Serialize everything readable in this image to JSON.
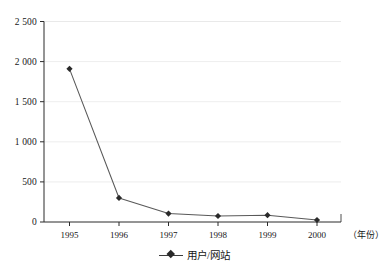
{
  "chart_data": {
    "type": "line",
    "title": "",
    "subtitle": "",
    "xlabel": "（年份）",
    "ylabel": "",
    "categories": [
      "1995",
      "1996",
      "1997",
      "1998",
      "1999",
      "2000"
    ],
    "series": [
      {
        "name": "用户/网站",
        "values": [
          1910,
          300,
          105,
          75,
          85,
          25
        ]
      }
    ],
    "ylim": [
      0,
      2500
    ],
    "yticks": [
      0,
      500,
      1000,
      1500,
      2000,
      2500
    ],
    "ytick_labels": [
      "0",
      "500",
      "1 000",
      "1 500",
      "2 000",
      "2 500"
    ],
    "xtick_labels": [
      "1995",
      "1996",
      "1997",
      "1998",
      "1999",
      "2000"
    ],
    "grid": "horizontal",
    "legend_position": "bottom-center",
    "legend_entries": [
      "用户/网站"
    ],
    "colors": {
      "line": "#555555",
      "marker": "#2a2a2a",
      "axis": "#2b2b2b",
      "grid": "#e2e2e2",
      "background": "#ffffff"
    }
  },
  "axes": {
    "y_labels": [
      "2 500",
      "2 000",
      "1 500",
      "1 000",
      "500",
      "0"
    ],
    "x_labels": [
      "1995",
      "1996",
      "1997",
      "1998",
      "1999",
      "2000"
    ],
    "x_unit": "（年份）"
  },
  "legend": {
    "label": "用户/网站"
  }
}
